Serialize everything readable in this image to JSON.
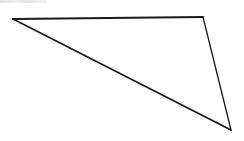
{
  "diagram": {
    "type": "triangle",
    "canvas": {
      "width": 244,
      "height": 141,
      "background": "#ffffff"
    },
    "stroke_color": "#1a1a1a",
    "fill": "none",
    "vertices": [
      {
        "name": "top-left",
        "x": 13,
        "y": 19
      },
      {
        "name": "top-right",
        "x": 203,
        "y": 17
      },
      {
        "name": "bottom-right",
        "x": 231,
        "y": 130
      }
    ],
    "edges": [
      {
        "name": "top-edge",
        "from": "top-left",
        "to": "top-right",
        "width": 2
      },
      {
        "name": "right-edge",
        "from": "top-right",
        "to": "bottom-right",
        "width": 1.3
      },
      {
        "name": "hypotenuse-edge",
        "from": "bottom-right",
        "to": "top-left",
        "width": 1.8
      }
    ]
  },
  "cropped_label": {
    "text": ""
  }
}
